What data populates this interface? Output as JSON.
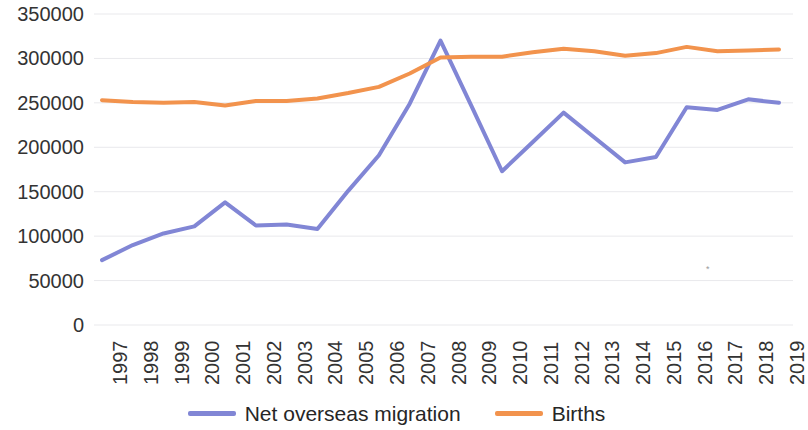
{
  "chart_data": {
    "type": "line",
    "title": "",
    "subtitle": "",
    "xlabel": "",
    "ylabel": "",
    "categories": [
      "1997",
      "1998",
      "1999",
      "2000",
      "2001",
      "2002",
      "2003",
      "2004",
      "2005",
      "2006",
      "2007",
      "2008",
      "2009",
      "2010",
      "2011",
      "2012",
      "2013",
      "2014",
      "2015",
      "2016",
      "2017",
      "2018",
      "2019"
    ],
    "series": [
      {
        "name": "Net overseas migration",
        "color": "#8186d5",
        "values": [
          73000,
          90000,
          103000,
          111000,
          138000,
          112000,
          113000,
          108000,
          151000,
          191000,
          249000,
          320000,
          247000,
          173000,
          206000,
          239000,
          211000,
          183000,
          189000,
          245000,
          242000,
          254000,
          250000
        ]
      },
      {
        "name": "Births",
        "color": "#f2934d",
        "values": [
          253000,
          251000,
          250000,
          251000,
          247000,
          252000,
          252000,
          255000,
          261000,
          268000,
          283000,
          301000,
          302000,
          302000,
          307000,
          311000,
          308000,
          303000,
          306000,
          313000,
          308000,
          309000,
          310000
        ]
      }
    ],
    "ylim": [
      0,
      350000
    ],
    "ytick_values": [
      0,
      50000,
      100000,
      150000,
      200000,
      250000,
      300000,
      350000
    ],
    "ytick_labels": [
      "0",
      "50000",
      "100000",
      "150000",
      "200000",
      "250000",
      "300000",
      "350000"
    ],
    "xtick_labels": [
      "1997",
      "1998",
      "1999",
      "2000",
      "2001",
      "2002",
      "2003",
      "2004",
      "2005",
      "2006",
      "2007",
      "2008",
      "2009",
      "2010",
      "2011",
      "2012",
      "2013",
      "2014",
      "2015",
      "2016",
      "2017",
      "2018",
      "2019"
    ],
    "grid": {
      "horizontal": true,
      "vertical": false,
      "color": "#e9e9ec"
    },
    "legend": {
      "position": "bottom",
      "entries": [
        {
          "label": "Net overseas migration",
          "color": "#8186d5"
        },
        {
          "label": "Births",
          "color": "#f2934d"
        }
      ]
    },
    "plot_area": {
      "left": 102,
      "right": 779,
      "top": 14,
      "bottom": 325
    },
    "line_width": 4
  },
  "artifacts": {
    "speck_mark": "*"
  }
}
